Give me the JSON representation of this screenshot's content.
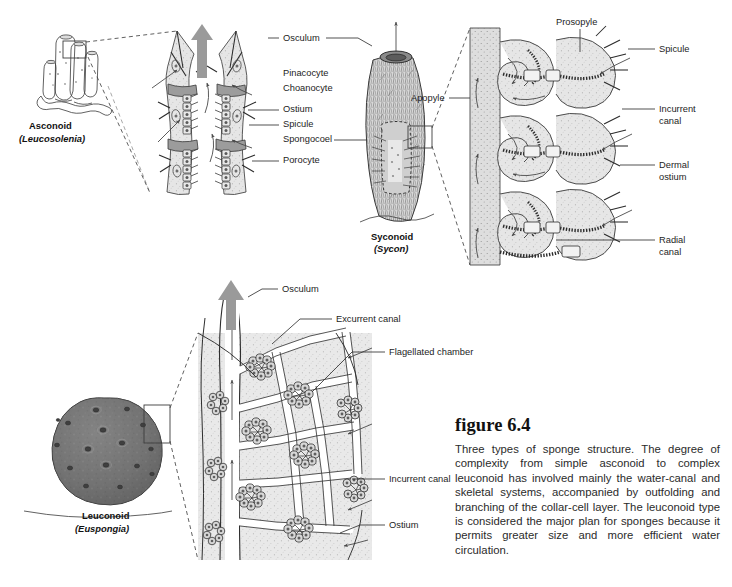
{
  "figure": {
    "heading": "figure 6.4",
    "caption": "Three types of sponge structure. The degree of complexity from simple asconoid to complex leuconoid has involved mainly the water-canal and skeletal systems, accompanied by outfolding and branching of the collar-cell layer. The leuconoid type is considered the major plan for sponges because it permits greater size and more efficient water circulation."
  },
  "panels": {
    "asconoid": {
      "type_name": "Asconoid",
      "genus": "(Leucosolenia)"
    },
    "syconoid": {
      "type_name": "Syconoid",
      "genus": "(Sycon)"
    },
    "leuconoid": {
      "type_name": "Leuconoid",
      "genus": "(Euspongia)"
    }
  },
  "labels": {
    "center_column": [
      {
        "text": "Osculum",
        "leader_left": true,
        "leader_right": true
      },
      {
        "text": "Pinacocyte",
        "leader_left": false,
        "leader_right": false
      },
      {
        "text": "Choanocyte",
        "leader_left": false,
        "leader_right": false
      },
      {
        "text": "Ostium",
        "leader_left": true,
        "leader_right": false
      },
      {
        "text": "Spicule",
        "leader_left": true,
        "leader_right": false
      },
      {
        "text": "Spongocoel",
        "leader_left": false,
        "leader_right": true
      },
      {
        "text": "Porocyte",
        "leader_left": true,
        "leader_right": false
      }
    ],
    "syconoid_enlargement": {
      "prosopyle": "Prosopyle",
      "apopyle": "Apopyle",
      "spicule": "Spicule",
      "incurrent_canal_l1": "Incurrent",
      "incurrent_canal_l2": "canal",
      "dermal_ostium_l1": "Dermal",
      "dermal_ostium_l2": "ostium",
      "radial_canal_l1": "Radial",
      "radial_canal_l2": "canal"
    },
    "leuconoid_enlargement": {
      "osculum": "Osculum",
      "excurrent_canal": "Excurrent canal",
      "flagellated_chamber": "Flagellated chamber",
      "incurrent_canal": "Incurrent canal",
      "ostium": "Ostium"
    }
  },
  "colors": {
    "background": "#ffffff",
    "ink": "#333333",
    "tissue_fill": "#e3e3e3",
    "sphere_dark": "#6e6e6e",
    "flow_arrow": "#9a9a9a",
    "text": "#1a1a1a"
  }
}
